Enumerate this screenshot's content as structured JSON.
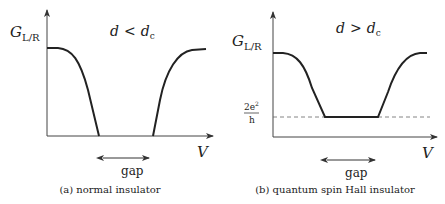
{
  "panels": [
    {
      "id": "a",
      "ylabel_main": "G",
      "ylabel_sub": "L/R",
      "condition_lhs": "d",
      "condition_op": "<",
      "condition_rhs": "d",
      "condition_rhs_sub": "c",
      "xlabel": "V",
      "gap_label": "gap",
      "caption": "(a)  normal insulator"
    },
    {
      "id": "b",
      "ylabel_main": "G",
      "ylabel_sub": "L/R",
      "condition_lhs": "d",
      "condition_op": ">",
      "condition_rhs": "d",
      "condition_rhs_sub": "c",
      "xlabel": "V",
      "gap_label": "gap",
      "level_num": "2e",
      "level_num_sup": "2",
      "level_den": "h",
      "caption": "(b)  quantum spin Hall insulator"
    }
  ],
  "colors": {
    "ink": "#222222",
    "dashed": "#555555",
    "background": "#ffffff"
  }
}
